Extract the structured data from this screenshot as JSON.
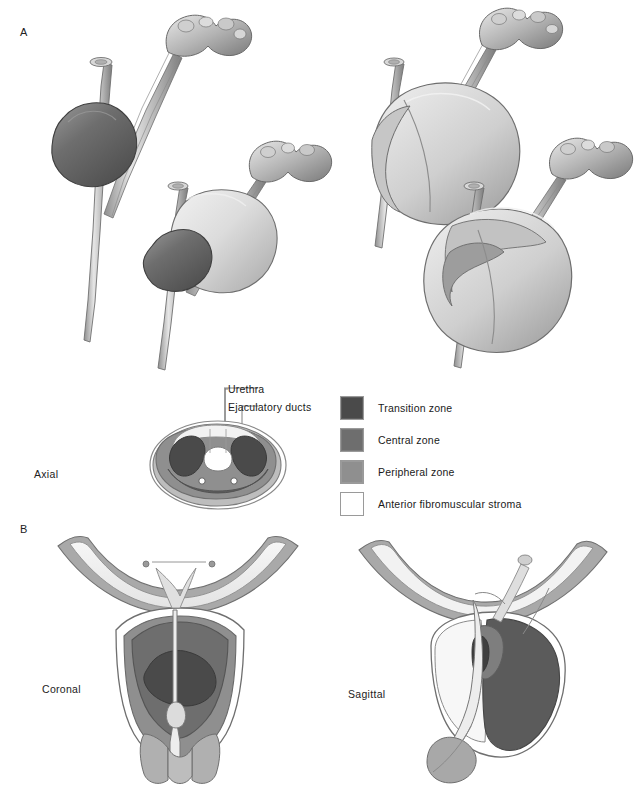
{
  "figure": {
    "panels": [
      {
        "id": "A",
        "label": "A"
      },
      {
        "id": "B",
        "label": "B"
      }
    ]
  },
  "panelA": {
    "label": "A",
    "axial_view_label": "Axial",
    "callouts": [
      {
        "name": "urethra",
        "label": "Urethra"
      },
      {
        "name": "ejaculatory-ducts",
        "label": "Ejaculatory ducts"
      }
    ],
    "renderings": [
      {
        "name": "prostate-3d-central-zone",
        "position": "top-left"
      },
      {
        "name": "prostate-3d-central-peripheral",
        "position": "middle-left"
      },
      {
        "name": "prostate-3d-whole-gland",
        "position": "top-right"
      },
      {
        "name": "prostate-3d-whole-gland-cutaway",
        "position": "middle-right"
      }
    ]
  },
  "panelB": {
    "label": "B",
    "views": [
      {
        "name": "coronal-section",
        "label": "Coronal"
      },
      {
        "name": "sagittal-section",
        "label": "Sagittal"
      }
    ]
  },
  "legend": {
    "items": [
      {
        "label": "Transition zone",
        "color": "#4a4a4a"
      },
      {
        "label": "Central zone",
        "color": "#6e6e6e"
      },
      {
        "label": "Peripheral zone",
        "color": "#8f8f8f"
      },
      {
        "label": "Anterior fibromuscular stroma",
        "color": "#ffffff"
      }
    ]
  },
  "colors": {
    "transition_zone": "#4a4a4a",
    "central_zone": "#6e6e6e",
    "peripheral_zone": "#8f8f8f",
    "anterior_fibromuscular_stroma": "#ffffff",
    "capsule_outline": "#8a8a8a",
    "tissue_light": "#d7d7d7",
    "tissue_mid": "#b5b5b5",
    "background": "#ffffff",
    "ink": "#1a1a1a"
  }
}
